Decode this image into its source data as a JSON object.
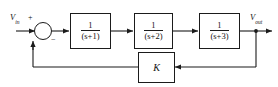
{
  "diagram": {
    "type": "control-system-block-diagram",
    "line_color": "#1b1b1b",
    "background_color": "#ffffff",
    "input": {
      "label_base": "V",
      "label_sub": "in",
      "label_full": "V_in"
    },
    "output": {
      "label_base": "V",
      "label_sub": "out",
      "label_full": "V_out"
    },
    "summing_junction": {
      "name": "summing-junction",
      "plus_sign": "+",
      "minus_sign": "−",
      "plus_input": "V_in",
      "minus_input": "K feedback"
    },
    "forward_blocks": [
      {
        "id": "block-1",
        "numerator": "1",
        "denominator": "(s+1)",
        "transfer_function": "1/(s+1)"
      },
      {
        "id": "block-2",
        "numerator": "1",
        "denominator": "(s+2)",
        "transfer_function": "1/(s+2)"
      },
      {
        "id": "block-3",
        "numerator": "1",
        "denominator": "(s+3)",
        "transfer_function": "1/(s+3)"
      }
    ],
    "feedback_block": {
      "id": "block-k",
      "label": "K",
      "description": "feedback gain"
    }
  }
}
